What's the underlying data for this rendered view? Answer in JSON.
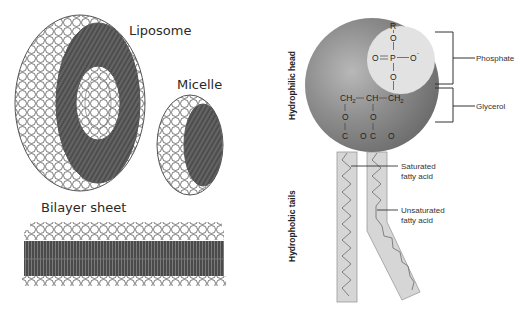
{
  "left_panel": {
    "liposome_label": "Liposome",
    "micelle_label": "Micelle",
    "bilayer_label": "Bilayer sheet"
  },
  "right_panel": {
    "axis_labels": {
      "head": "Hydrophilic head",
      "tails": "Hydrophobic tails"
    },
    "chem": {
      "r": "R",
      "o_top": "O",
      "o_left": "O",
      "eq": "=",
      "p": "P",
      "o_minus": "O",
      "minus": "-",
      "o_bottom": "O",
      "ch2_left": "CH",
      "ch2_sub": "2",
      "ch": "CH",
      "ch2_right": "CH",
      "o_a": "O",
      "o_b": "O",
      "c_a": "C",
      "o_c": "O",
      "c_b": "C",
      "o_d": "O"
    },
    "callouts": {
      "phosphate": "Phosphate",
      "glycerol": "Glycerol",
      "saturated_line1": "Saturated",
      "saturated_line2": "fatty acid",
      "unsaturated_line1": "Unsaturated",
      "unsaturated_line2": "fatty acid"
    },
    "colors": {
      "head_sphere": "#8a8a8a",
      "phosphate_disc": "#e2e2e2",
      "tail_fill": "#d6d6d6",
      "tail_stroke": "#9a9a9a"
    }
  }
}
